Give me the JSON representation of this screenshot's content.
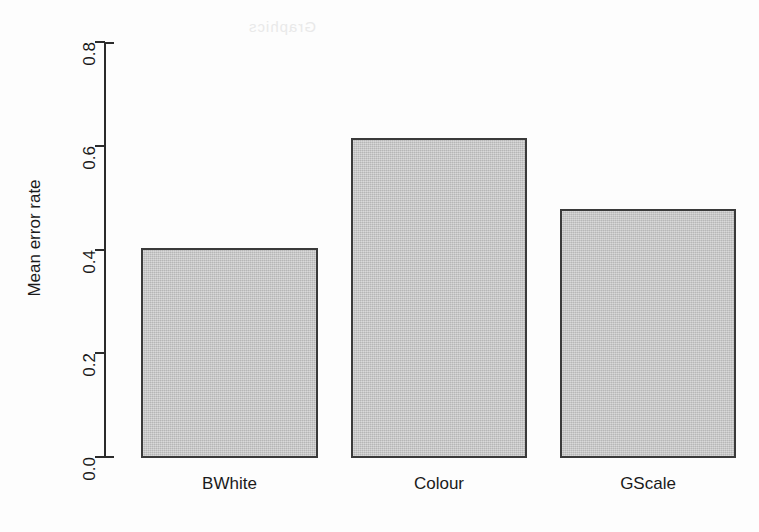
{
  "watermark": {
    "text": "Graphics"
  },
  "chart_data": {
    "type": "bar",
    "title": "",
    "subtitle": "",
    "xlabel": "",
    "ylabel": "Mean error rate",
    "categories": [
      "BWhite",
      "Colour",
      "GScale"
    ],
    "values": [
      0.403,
      0.614,
      0.478
    ],
    "ylim": [
      0.0,
      0.8
    ],
    "yticks": [
      "0.0",
      "0.2",
      "0.4",
      "0.6",
      "0.8"
    ],
    "ytick_values": [
      0.0,
      0.2,
      0.4,
      0.6,
      0.8
    ],
    "grid": false,
    "legend": false,
    "legend_position": "none",
    "bar_fill_color": "#c3c3c3",
    "bar_border_color": "#3a3a3a",
    "axis_color": "#2b2b2b",
    "background_color": "#fdfdfd",
    "annotations": []
  }
}
